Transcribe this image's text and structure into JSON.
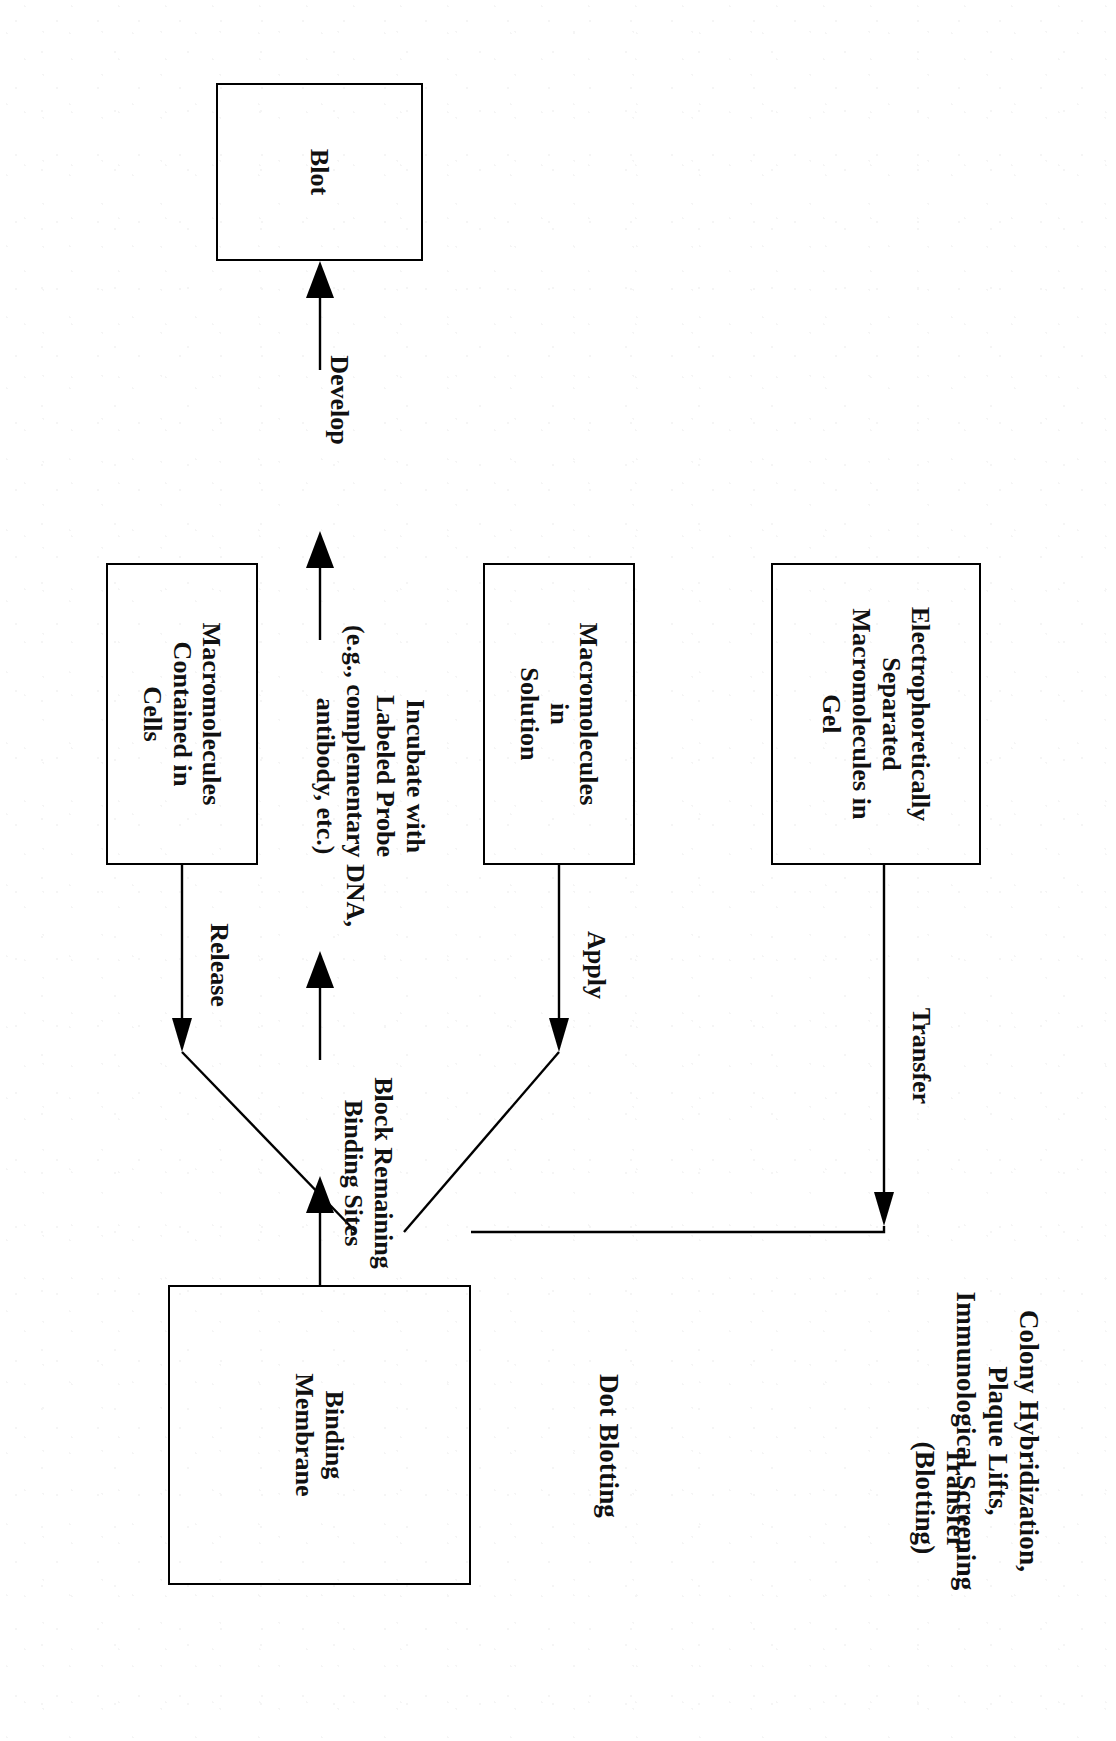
{
  "figure": {
    "orientation_degrees": 90,
    "background_color": "#ffffff",
    "ink_color": "#000000"
  },
  "column_headings": [
    {
      "id": "heading-colony",
      "text": "Colony Hybridization,\nPlaque Lifts,\nImmunological Screening"
    },
    {
      "id": "heading-dot",
      "text": "Dot Blotting"
    },
    {
      "id": "heading-transfer",
      "text": "Transfer\n(Blotting)"
    }
  ],
  "source_nodes": [
    {
      "id": "node-cells",
      "text": "Macromolecules\nContained in\nCells"
    },
    {
      "id": "node-solution",
      "text": "Macromolecules\nin\nSolution"
    },
    {
      "id": "node-gel",
      "text": "Electrophoretically\nSeparated\nMacromolecules in\nGel"
    }
  ],
  "source_edge_labels": [
    {
      "id": "edge-release",
      "text": "Release"
    },
    {
      "id": "edge-apply",
      "text": "Apply"
    },
    {
      "id": "edge-transfer",
      "text": "Transfer"
    }
  ],
  "process_nodes": [
    {
      "id": "node-membrane",
      "text": "Binding\nMembrane"
    },
    {
      "id": "node-blot",
      "text": "Blot"
    }
  ],
  "process_edge_labels": [
    {
      "id": "edge-block",
      "text": "Block Remaining\nBinding Sites"
    },
    {
      "id": "edge-incubate",
      "text": "Incubate with\nLabeled Probe\n(e.g., complementary DNA,\nantibody, etc.)"
    },
    {
      "id": "edge-develop",
      "text": "Develop"
    }
  ]
}
